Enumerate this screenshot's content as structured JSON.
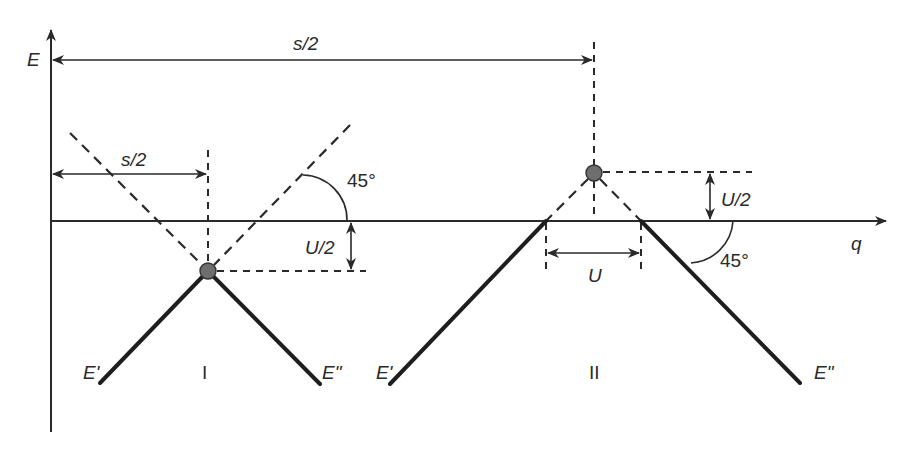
{
  "axes": {
    "y_label": "E",
    "x_label": "q"
  },
  "dimensions": {
    "top_span_label": "s/2",
    "left_span_label": "s/2",
    "left_gap_label": "U/2",
    "right_gap_label": "U/2",
    "right_width_label": "U",
    "left_angle_label": "45°",
    "right_angle_label": "45°"
  },
  "cases": [
    {
      "id": "I",
      "label": "I",
      "branch_left": "E'",
      "branch_right": "E\""
    },
    {
      "id": "II",
      "label": "II",
      "branch_left": "E'",
      "branch_right": "E\""
    }
  ],
  "colors": {
    "line": "#1e1e1e",
    "point_fill": "#6e6e6e",
    "background": "#ffffff"
  }
}
